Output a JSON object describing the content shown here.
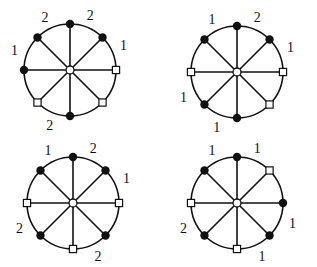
{
  "diagrams": [
    {
      "id": "top-left",
      "center": [
        70,
        70
      ],
      "radius": 46,
      "nodes": [
        {
          "angle": 90,
          "type": "filled",
          "label": "2"
        },
        {
          "angle": 45,
          "type": "filled",
          "label": "1"
        },
        {
          "angle": 0,
          "type": "open-square",
          "label": ""
        },
        {
          "angle": -45,
          "type": "open-square",
          "label": ""
        },
        {
          "angle": -90,
          "type": "filled",
          "label": "2"
        },
        {
          "angle": -135,
          "type": "open-square",
          "label": ""
        },
        {
          "angle": 180,
          "type": "filled",
          "label": "1"
        },
        {
          "angle": 135,
          "type": "filled",
          "label": "2"
        }
      ]
    },
    {
      "id": "top-right",
      "center": [
        237,
        72
      ],
      "radius": 46,
      "nodes": [
        {
          "angle": 90,
          "type": "filled",
          "label": "2"
        },
        {
          "angle": 45,
          "type": "filled",
          "label": "1"
        },
        {
          "angle": 0,
          "type": "open-square",
          "label": ""
        },
        {
          "angle": -45,
          "type": "open-square",
          "label": ""
        },
        {
          "angle": -90,
          "type": "filled",
          "label": "1"
        },
        {
          "angle": -135,
          "type": "filled",
          "label": "1"
        },
        {
          "angle": 180,
          "type": "open-square",
          "label": ""
        },
        {
          "angle": 135,
          "type": "filled",
          "label": "1"
        }
      ]
    },
    {
      "id": "bottom-left",
      "center": [
        73,
        203
      ],
      "radius": 46,
      "nodes": [
        {
          "angle": 90,
          "type": "filled",
          "label": "2"
        },
        {
          "angle": 45,
          "type": "filled",
          "label": "1"
        },
        {
          "angle": 0,
          "type": "open-square",
          "label": ""
        },
        {
          "angle": -45,
          "type": "filled",
          "label": "2"
        },
        {
          "angle": -90,
          "type": "open-square",
          "label": ""
        },
        {
          "angle": -135,
          "type": "filled",
          "label": "2"
        },
        {
          "angle": 180,
          "type": "open-square",
          "label": ""
        },
        {
          "angle": 135,
          "type": "filled",
          "label": "1"
        }
      ]
    },
    {
      "id": "bottom-right",
      "center": [
        237,
        203
      ],
      "radius": 46,
      "nodes": [
        {
          "angle": 90,
          "type": "filled",
          "label": "1"
        },
        {
          "angle": 45,
          "type": "open-square",
          "label": ""
        },
        {
          "angle": 0,
          "type": "filled",
          "label": "1"
        },
        {
          "angle": -45,
          "type": "filled",
          "label": "1"
        },
        {
          "angle": -90,
          "type": "open-square",
          "label": ""
        },
        {
          "angle": -135,
          "type": "filled",
          "label": "2"
        },
        {
          "angle": 180,
          "type": "open-square",
          "label": ""
        },
        {
          "angle": 135,
          "type": "filled",
          "label": "1"
        }
      ]
    }
  ]
}
